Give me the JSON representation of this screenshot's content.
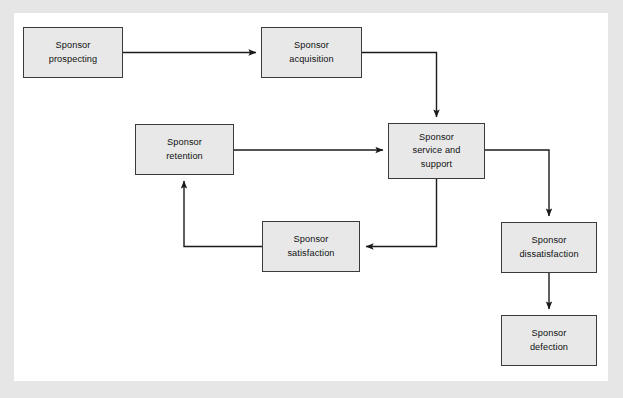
{
  "canvas": {
    "width": 623,
    "height": 398,
    "frame_color": "#e6e6e6",
    "panel_color": "#ffffff"
  },
  "diagram": {
    "type": "flowchart",
    "node_fill": "#e8e8e8",
    "node_border": "#3a3a3a",
    "connector_color": "#1a1a1a",
    "nodes": [
      {
        "id": "prospecting",
        "label": "Sponsor\nprospecting",
        "x": 23,
        "y": 27,
        "w": 100,
        "h": 51
      },
      {
        "id": "acquisition",
        "label": "Sponsor\nacquisition",
        "x": 261,
        "y": 27,
        "w": 101,
        "h": 51
      },
      {
        "id": "service",
        "label": "Sponsor\nservice and\nsupport",
        "x": 388,
        "y": 123,
        "w": 97,
        "h": 56
      },
      {
        "id": "retention",
        "label": "Sponsor\nretention",
        "x": 135,
        "y": 124,
        "w": 99,
        "h": 51
      },
      {
        "id": "satisfaction",
        "label": "Sponsor\nsatisfaction",
        "x": 262,
        "y": 221,
        "w": 98,
        "h": 51
      },
      {
        "id": "dissatisfaction",
        "label": "Sponsor\ndissatisfaction",
        "x": 501,
        "y": 222,
        "w": 96,
        "h": 51
      },
      {
        "id": "defection",
        "label": "Sponsor\ndefection",
        "x": 501,
        "y": 315,
        "w": 96,
        "h": 51
      }
    ],
    "edges": [
      {
        "id": "prospecting-to-acquisition",
        "from": "prospecting",
        "to": "acquisition"
      },
      {
        "id": "acquisition-to-service",
        "from": "acquisition",
        "to": "service"
      },
      {
        "id": "retention-to-service",
        "from": "retention",
        "to": "service"
      },
      {
        "id": "service-to-satisfaction",
        "from": "service",
        "to": "satisfaction"
      },
      {
        "id": "satisfaction-to-retention",
        "from": "satisfaction",
        "to": "retention"
      },
      {
        "id": "service-to-dissatisfaction",
        "from": "service",
        "to": "dissatisfaction"
      },
      {
        "id": "dissatisfaction-to-defection",
        "from": "dissatisfaction",
        "to": "defection"
      }
    ]
  }
}
